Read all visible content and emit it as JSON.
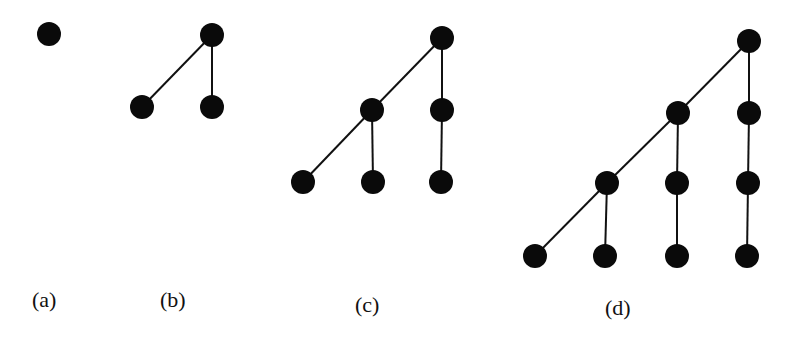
{
  "diagram": {
    "trees": [
      {
        "label": "(a)",
        "nodes": [
          "r"
        ],
        "edges": []
      },
      {
        "label": "(b)",
        "nodes": [
          "r",
          "c1",
          "c2"
        ],
        "edges": [
          [
            "r",
            "c1"
          ],
          [
            "r",
            "c2"
          ]
        ]
      },
      {
        "label": "(c)",
        "nodes": [
          "r",
          "a",
          "b",
          "a1",
          "a2",
          "b1"
        ],
        "edges": [
          [
            "r",
            "a"
          ],
          [
            "r",
            "b"
          ],
          [
            "a",
            "a1"
          ],
          [
            "a",
            "a2"
          ],
          [
            "b",
            "b1"
          ]
        ]
      },
      {
        "label": "(d)",
        "nodes": [
          "r",
          "a",
          "b",
          "a1",
          "a2",
          "b1",
          "a11",
          "a12",
          "a21",
          "b11"
        ],
        "edges": [
          [
            "r",
            "a"
          ],
          [
            "r",
            "b"
          ],
          [
            "a",
            "a1"
          ],
          [
            "a",
            "a2"
          ],
          [
            "b",
            "b1"
          ],
          [
            "a1",
            "a11"
          ],
          [
            "a1",
            "a12"
          ],
          [
            "a2",
            "a21"
          ],
          [
            "b1",
            "b11"
          ]
        ]
      }
    ]
  }
}
